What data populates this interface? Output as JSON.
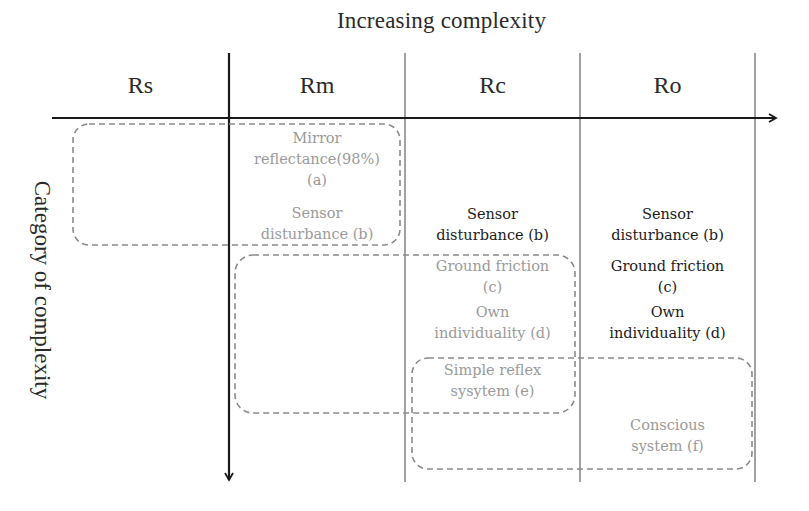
{
  "diagram": {
    "title": "Increasing complexity",
    "y_axis_label": "Category of complexity",
    "columns": [
      {
        "id": "rs",
        "label": "Rs"
      },
      {
        "id": "rm",
        "label": "Rm"
      },
      {
        "id": "rc",
        "label": "Rc"
      },
      {
        "id": "ro",
        "label": "Ro"
      }
    ],
    "cells": {
      "rm_a_line1": "Mirror",
      "rm_a_line2": "reflectance(98%)",
      "rm_a_line3": "(a)",
      "rm_b_line1": "Sensor",
      "rm_b_line2": "disturbance (b)",
      "rc_b_line1": "Sensor",
      "rc_b_line2": "disturbance (b)",
      "rc_c_line1": "Ground friction",
      "rc_c_line2": "(c)",
      "rc_d_line1": "Own",
      "rc_d_line2": "individuality (d)",
      "rc_e_line1": "Simple reflex",
      "rc_e_line2": "sysytem (e)",
      "ro_b_line1": "Sensor",
      "ro_b_line2": "disturbance (b)",
      "ro_c_line1": "Ground friction",
      "ro_c_line2": "(c)",
      "ro_d_line1": "Own",
      "ro_d_line2": "individuality (d)",
      "ro_f_line1": "Conscious",
      "ro_f_line2": "system (f)"
    },
    "colors": {
      "axis": "#1a1a1a",
      "grid": "#444444",
      "dashed_box": "#8a8a8a",
      "dim_text": "#9a9a9a",
      "dark_text": "#1c1c1c"
    }
  }
}
